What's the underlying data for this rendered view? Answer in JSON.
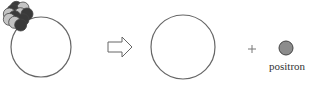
{
  "diagram": {
    "parent_nucleus": {
      "center": [
        41,
        47
      ],
      "radius": 30,
      "particles": [
        {
          "type": "dark",
          "x": 49,
          "y": 22
        },
        {
          "type": "light",
          "x": 69,
          "y": 24
        },
        {
          "type": "dark",
          "x": 39,
          "y": 32
        },
        {
          "type": "light",
          "x": 28,
          "y": 42
        },
        {
          "type": "light",
          "x": 61,
          "y": 41
        },
        {
          "type": "dark",
          "x": 81,
          "y": 42
        },
        {
          "type": "dark",
          "x": 44,
          "y": 50
        },
        {
          "type": "light",
          "x": 28,
          "y": 58
        },
        {
          "type": "dark",
          "x": 69,
          "y": 59
        },
        {
          "type": "light",
          "x": 44,
          "y": 67
        },
        {
          "type": "dark",
          "x": 62,
          "y": 75
        }
      ]
    },
    "arrow": "right-arrow",
    "daughter_nucleus": {
      "center": [
        183,
        47
      ],
      "radius": 32,
      "contents": "empty"
    },
    "operator": "+",
    "emitted_particle": {
      "label": "positron",
      "center": [
        286,
        48
      ],
      "radius": 7
    },
    "colors": {
      "dark": "#3a3a3a",
      "light": "#c4c4c4",
      "positron": "#8c8c8c",
      "stroke": "#555555"
    }
  }
}
